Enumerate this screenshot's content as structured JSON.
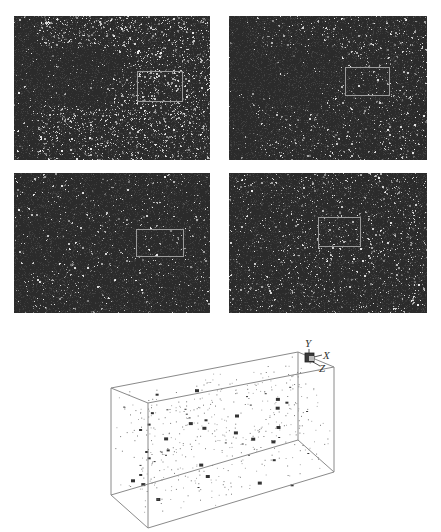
{
  "figure": {
    "caption_fragment": "",
    "panels": [
      {
        "id": "top-left",
        "x": 14,
        "y": 16,
        "w": 196,
        "h": 144,
        "density": 0.42,
        "dark_wedge": true,
        "roi": {
          "x": 123,
          "y": 55,
          "w": 46,
          "h": 31
        }
      },
      {
        "id": "top-right",
        "x": 229,
        "y": 16,
        "w": 198,
        "h": 144,
        "density": 0.28,
        "dark_wedge": true,
        "roi": {
          "x": 116,
          "y": 51,
          "w": 45,
          "h": 29
        }
      },
      {
        "id": "bottom-left",
        "x": 14,
        "y": 173,
        "w": 196,
        "h": 140,
        "density": 0.22,
        "dark_wedge": false,
        "roi": {
          "x": 122,
          "y": 56,
          "w": 48,
          "h": 28
        }
      },
      {
        "id": "bottom-right",
        "x": 229,
        "y": 173,
        "w": 198,
        "h": 140,
        "density": 0.3,
        "dark_wedge": false,
        "roi": {
          "x": 89,
          "y": 44,
          "w": 43,
          "h": 30
        }
      }
    ],
    "volume_render": {
      "axes": {
        "y_label": "Y",
        "x_label": "X",
        "z_label": "Z"
      },
      "particle_count": 520
    }
  },
  "colors": {
    "panel_bg": "#2b2b2b",
    "roi_border": "#9c9c9c",
    "box_edge": "#8a8a8a",
    "particle": "#444444"
  }
}
